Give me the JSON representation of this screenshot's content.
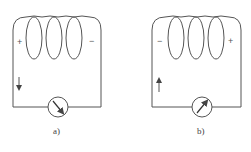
{
  "diagrams": [
    {
      "id": "a",
      "caption": "a)",
      "left_sign": "+",
      "right_sign": "−",
      "current_arrow": "down",
      "needle_direction": "right"
    },
    {
      "id": "b",
      "caption": "b)",
      "left_sign": "−",
      "right_sign": "+",
      "current_arrow": "up",
      "needle_direction": "left"
    }
  ],
  "colors": {
    "line": "#555555",
    "background": "#ffffff"
  }
}
